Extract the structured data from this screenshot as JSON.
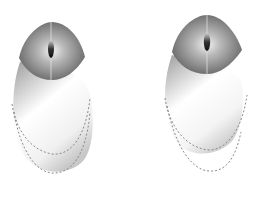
{
  "image": {
    "description": "Two computer mice shown from above with grey gradient shells, dark grey button areas with central scroll wheels, and dashed outline curves beneath",
    "background": "#ffffff"
  },
  "mice": [
    {
      "label": "mouse-left",
      "cap_color": "#6e6e6e",
      "cap_highlight": "#d8d8d8",
      "body_dark": "#a9a9a9",
      "body_light": "#ffffff",
      "wheel_color": "#1c1c1c",
      "dash_color": "#8a8a8a"
    },
    {
      "label": "mouse-right",
      "cap_color": "#6e6e6e",
      "cap_highlight": "#d8d8d8",
      "body_dark": "#a9a9a9",
      "body_light": "#ffffff",
      "wheel_color": "#1c1c1c",
      "dash_color": "#8a8a8a"
    }
  ]
}
